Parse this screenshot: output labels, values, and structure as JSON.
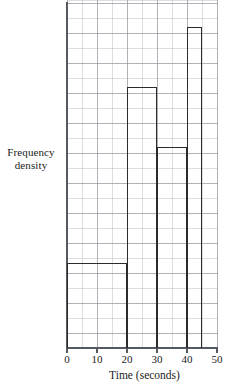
{
  "chart_data": {
    "type": "bar",
    "title": "",
    "subtitle": "",
    "xlabel": "Time (seconds)",
    "ylabel": "Frequency density",
    "ylabel_lines": [
      "Frequency",
      "density"
    ],
    "xlim": [
      0,
      50
    ],
    "ylim": [
      0,
      23.2
    ],
    "x_ticks": [
      0,
      10,
      20,
      30,
      40,
      50
    ],
    "x_tick_labels": [
      "0",
      "10",
      "20",
      "30",
      "40",
      "50"
    ],
    "y_ticks": [],
    "y_tick_labels": [],
    "grid": true,
    "grid_minor_step_x": 5,
    "grid_minor_step_y": 1,
    "grid_major_step_x": 10,
    "grid_major_step_y": 2,
    "legend": false,
    "legend_position": "none",
    "bin_edges": [
      0,
      20,
      30,
      40,
      45
    ],
    "categories": [
      "0-20",
      "20-30",
      "30-40",
      "40-45"
    ],
    "values": [
      5.7,
      17.4,
      13.4,
      21.4
    ],
    "bars": [
      {
        "label": "0-20",
        "x_start": 0,
        "x_end": 20,
        "density": 5.7
      },
      {
        "label": "20-30",
        "x_start": 20,
        "x_end": 30,
        "density": 17.4
      },
      {
        "label": "30-40",
        "x_start": 30,
        "x_end": 40,
        "density": 13.4
      },
      {
        "label": "40-45",
        "x_start": 40,
        "x_end": 45,
        "density": 21.4
      }
    ],
    "colors": {
      "bar_outline": "#2b2b2b",
      "bar_fill": "#ffffff",
      "axis": "#555a60",
      "grid_major": "#8c8c96",
      "grid_minor": "#afafb9",
      "text": "#1b1b1b",
      "background": "#ffffff"
    }
  }
}
